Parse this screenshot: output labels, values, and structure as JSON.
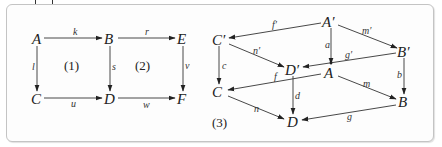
{
  "figure": {
    "colors": {
      "ink": "#222222",
      "frame_border": "#c4c4c4",
      "background": "#fdfdfd"
    }
  },
  "diagram_left": {
    "nodes": {
      "A": "A",
      "B": "B",
      "E": "E",
      "C": "C",
      "D": "D",
      "F": "F"
    },
    "edges": {
      "k": "k",
      "r": "r",
      "l": "l",
      "s": "s",
      "v": "v",
      "u": "u",
      "w": "w"
    },
    "regions": {
      "one": "(1)",
      "two": "(2)"
    }
  },
  "diagram_right": {
    "nodes": {
      "A_prime": "A′",
      "B_prime": "B′",
      "C_prime": "C′",
      "D_prime": "D′",
      "A": "A",
      "B": "B",
      "C": "C",
      "D": "D"
    },
    "edges": {
      "f_prime": "f′",
      "m_prime": "m′",
      "n_prime": "n′",
      "g_prime": "g′",
      "a": "a",
      "b": "b",
      "c": "c",
      "d": "d",
      "f": "f",
      "m": "m",
      "n": "n",
      "g": "g"
    },
    "regions": {
      "three": "(3)"
    }
  }
}
